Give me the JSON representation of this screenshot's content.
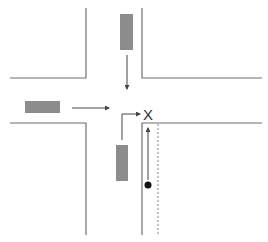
{
  "diagram": {
    "type": "traffic-intersection",
    "colors": {
      "background": "#ffffff",
      "road_edge": "#6e6e6e",
      "car": "#8c8c8c",
      "arrow": "#444444",
      "pedestrian": "#111111"
    },
    "labels": {
      "collision_point": "X"
    },
    "vehicles": [
      {
        "id": "car-north",
        "heading": "south",
        "description": "Car approaching from top, moving down"
      },
      {
        "id": "car-west",
        "heading": "east",
        "description": "Car approaching from left, moving right"
      },
      {
        "id": "car-south",
        "heading": "north-then-east",
        "description": "Car from bottom turning right toward X"
      }
    ],
    "pedestrian": {
      "id": "cyclist-or-pedestrian",
      "heading": "north",
      "description": "Dot moving up along the lane toward X"
    }
  }
}
